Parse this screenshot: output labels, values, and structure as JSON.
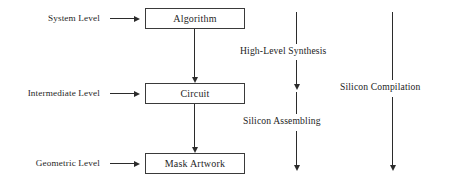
{
  "diagram": {
    "background_color": "#ffffff",
    "line_color": "#2b2b2b",
    "text_color": "#232323",
    "levels": [
      {
        "label": "System Level"
      },
      {
        "label": "Intermediate Level"
      },
      {
        "label": "Geometric Level"
      }
    ],
    "boxes": [
      {
        "label": "Algorithm"
      },
      {
        "label": "Circuit"
      },
      {
        "label": "Mask Artwork"
      }
    ],
    "flows": [
      {
        "label": "High-Level Synthesis"
      },
      {
        "label": "Silicon Assembling"
      },
      {
        "label": "Silicon Compilation"
      }
    ],
    "icons": {
      "pointer_arrow": "arrow-right-icon",
      "flow_arrow": "arrow-down-icon"
    }
  }
}
